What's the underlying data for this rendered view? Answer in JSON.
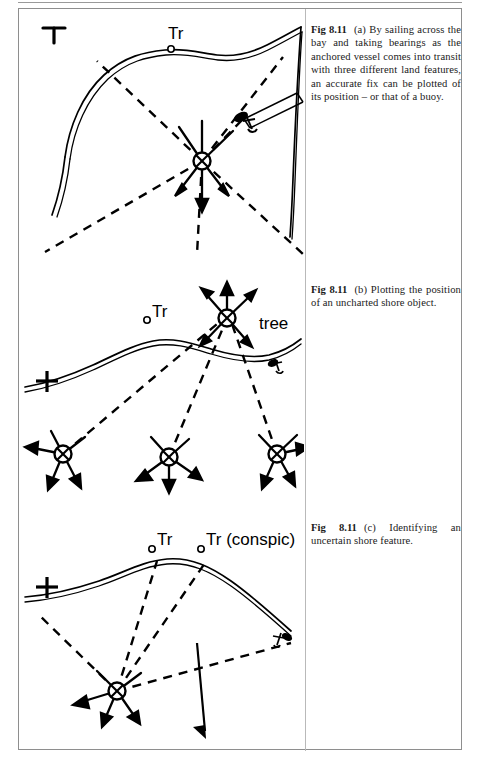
{
  "document": {
    "figure_number": "Fig 8.11",
    "page_background": "#ffffff",
    "ink_color": "#000000",
    "frame_color": "#8e8e8e"
  },
  "figures": [
    {
      "id": "a",
      "caption_label": "Fig 8.11",
      "caption_part": "(a)",
      "caption_text": "By sailing across the bay and taking bearings as the anchored vessel comes into transit with three different land features, an accurate fix can be plotted of its position – or that of a buoy.",
      "map_labels": [
        {
          "name": "church-symbol",
          "text": "",
          "symbol": "church-cross"
        },
        {
          "name": "tower-label",
          "text": "Tr",
          "symbol": "position-circle"
        }
      ],
      "symbols": {
        "fix": "circled-cross-fix",
        "vessel": "anchored-vessel",
        "bearing_lines": "dashed",
        "arrows": 5
      }
    },
    {
      "id": "b",
      "caption_label": "Fig 8.11",
      "caption_part": "(b)",
      "caption_text": "Plotting the position of an uncharted shore object.",
      "map_labels": [
        {
          "name": "tower-label",
          "text": "Tr",
          "symbol": "position-circle"
        },
        {
          "name": "tree-label",
          "text": "tree",
          "symbol": "circled-cross-fix"
        },
        {
          "name": "cross-symbol",
          "text": "",
          "symbol": "plus-cross"
        }
      ],
      "symbols": {
        "fix": "circled-cross-fix",
        "vessel_positions": 3,
        "bearing_lines": "dashed"
      }
    },
    {
      "id": "c",
      "caption_label": "Fig 8.11",
      "caption_part": "(c)",
      "caption_text": "Identifying an uncertain shore feature.",
      "map_labels": [
        {
          "name": "tower-label",
          "text": "Tr",
          "symbol": "position-circle"
        },
        {
          "name": "tower-conspic-label",
          "text": "Tr (conspic)",
          "symbol": "position-circle"
        },
        {
          "name": "cross-symbol",
          "text": "",
          "symbol": "plus-cross"
        }
      ],
      "symbols": {
        "fix": "circled-cross-fix",
        "vessel": "anchored-vessel",
        "bearing_lines": "dashed"
      }
    }
  ]
}
